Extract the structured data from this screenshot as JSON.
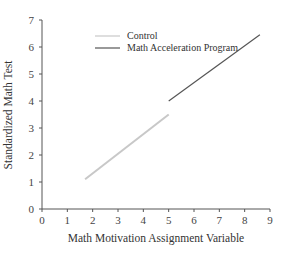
{
  "chart_data": {
    "type": "line",
    "title": "",
    "xlabel": "Math Motivation Assignment Variable",
    "ylabel": "Standardized Math Test",
    "xlim": [
      0,
      9
    ],
    "ylim": [
      0,
      7
    ],
    "x_ticks": [
      "0",
      "1",
      "2",
      "3",
      "4",
      "5",
      "6",
      "7",
      "8",
      "9"
    ],
    "y_ticks": [
      "0",
      "1",
      "2",
      "3",
      "4",
      "5",
      "6",
      "7"
    ],
    "grid": false,
    "legend_position": "upper-left-inside",
    "series": [
      {
        "name": "Control",
        "color": "#c8c8c8",
        "x": [
          1.7,
          5.0
        ],
        "y": [
          1.1,
          3.5
        ]
      },
      {
        "name": "Math Acceleration Program",
        "color": "#555555",
        "x": [
          5.0,
          8.6
        ],
        "y": [
          4.0,
          6.45
        ]
      }
    ]
  },
  "legend": {
    "items": [
      {
        "label": "Control",
        "color": "#c8c8c8"
      },
      {
        "label": "Math Acceleration Program",
        "color": "#555555"
      }
    ]
  }
}
